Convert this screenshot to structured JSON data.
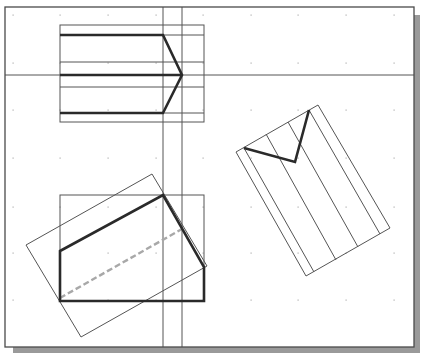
{
  "drawing": {
    "viewport": {
      "width": 422,
      "height": 353
    },
    "frame": {
      "x": 5,
      "y": 7,
      "width": 409,
      "height": 340,
      "stroke": "#4a4a4a"
    },
    "shadow": {
      "color": "#9a9a9a",
      "offset": 6
    },
    "colors": {
      "thin_line": "#555555",
      "thick_line": "#2a2a2a",
      "dashed_line": "#a8a8a8",
      "grid_dot": "#b0b0b0",
      "background": "#ffffff"
    },
    "grid": {
      "xs": [
        13,
        60,
        108,
        156,
        203,
        251,
        298,
        346,
        394
      ],
      "ys": [
        15,
        63,
        110,
        158,
        207,
        253,
        300
      ]
    },
    "construction_lines": {
      "horizontal_y": 75,
      "vertical_xs": [
        163,
        182
      ]
    },
    "top_view": {
      "bounding_rect": {
        "x": 60,
        "y": 25,
        "width": 144,
        "height": 97
      },
      "thin_horizontals": [
        62,
        87
      ],
      "thick_path": "M60,35 L163,35 L182,75 L163,113 L60,113 M60,75 L182,75"
    },
    "front_view": {
      "bounding_rect": {
        "x": 60,
        "y": 195,
        "width": 144,
        "height": 106
      },
      "rotated_rect": "26,245 152,174 207,266 81,337",
      "thick_polygon": "60,251 163,195 204,267 204,301 60,301",
      "dashed_line": {
        "x1": 60,
        "y1": 298,
        "x2": 182,
        "y2": 229
      }
    },
    "auxiliary_view": {
      "rotated_rect": "236,152 318,105 390,228 306,276",
      "parallel_lines": [
        {
          "x1": 244,
          "y1": 148,
          "x2": 314,
          "y2": 272
        },
        {
          "x1": 266,
          "y1": 134,
          "x2": 336,
          "y2": 260
        },
        {
          "x1": 288,
          "y1": 122,
          "x2": 358,
          "y2": 247
        },
        {
          "x1": 309,
          "y1": 110,
          "x2": 380,
          "y2": 234
        }
      ],
      "thick_v": "244,148 295,162 309,110"
    }
  }
}
